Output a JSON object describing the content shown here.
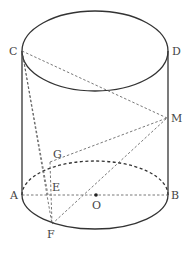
{
  "diagram": {
    "type": "cylinder-geometry",
    "labels": {
      "C": "C",
      "D": "D",
      "M": "M",
      "G": "G",
      "A": "A",
      "E": "E",
      "O": "O",
      "B": "B",
      "F": "F"
    },
    "points": {
      "C": [
        22,
        51
      ],
      "D": [
        168,
        51
      ],
      "M": [
        167,
        118
      ],
      "G": [
        50,
        162
      ],
      "A": [
        22,
        195
      ],
      "E": [
        48,
        195
      ],
      "O": [
        96,
        195
      ],
      "B": [
        168,
        195
      ],
      "F": [
        52,
        224
      ]
    },
    "segments_dashed": [
      "CM",
      "CE",
      "CF",
      "GM",
      "FM",
      "AB"
    ],
    "colors": {
      "stroke": "#333333",
      "label": "#444444",
      "background": "#ffffff"
    }
  }
}
